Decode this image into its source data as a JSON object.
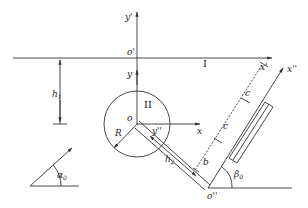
{
  "diagram": {
    "type": "mechanics coordinate-frame diagram",
    "labels": {
      "y_prime": "y'",
      "o_prime": "o'",
      "x_prime": "x'",
      "y": "y",
      "o": "o",
      "x": "x",
      "region_I": "I",
      "region_II": "II",
      "h1": "h",
      "h1_sub": "1",
      "R": "R",
      "y_dblprime": "y''",
      "h2": "h",
      "h2_sub": "2",
      "b": "b",
      "c1": "c",
      "c2": "c",
      "x_dblprime": "x''",
      "o_dblprime": "o''",
      "beta0": "β",
      "beta0_sub": "0",
      "alpha0": "α",
      "alpha0_sub": "0"
    },
    "colors": {
      "stroke": "#333333",
      "background": "#ffffff"
    }
  }
}
